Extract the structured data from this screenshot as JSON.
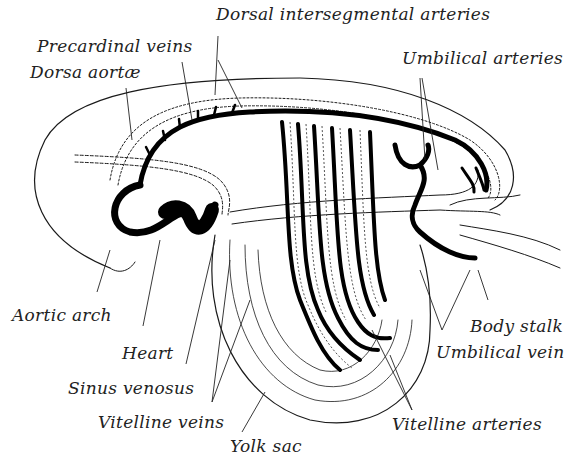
{
  "figure": {
    "colors": {
      "line": "#1a1a1a",
      "vessel_fill": "#000000",
      "background": "#ffffff"
    },
    "labels": {
      "dorsal_intersegmental_arteries": "Dorsal intersegmental arteries",
      "precardinal_veins": "Precardinal veins",
      "dorsa_aortae": "Dorsa aortæ",
      "umbilical_arteries": "Umbilical arteries",
      "aortic_arch": "Aortic arch",
      "heart": "Heart",
      "sinus_venosus": "Sinus venosus",
      "vitelline_veins": "Vitelline veins",
      "yolk_sac": "Yolk sac",
      "body_stalk": "Body stalk",
      "umbilical_vein": "Umbilical vein",
      "vitelline_arteries": "Vitelline arteries"
    }
  }
}
